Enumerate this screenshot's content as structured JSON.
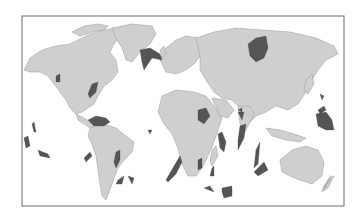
{
  "map": {
    "type": "world-map",
    "projection": "equirectangular-like",
    "colors": {
      "background": "#ffffff",
      "land": "#cfcfcf",
      "highlight_regions": "#555555",
      "frame": "#6a6a6a"
    },
    "highlighted_regions": [
      "Greenland-Iceland (North Atlantic)",
      "Columbia River (NW North America)",
      "Central Atlantic Margin (E North America)",
      "Caribbean",
      "Parana (South America)",
      "Ethiopian Traps",
      "Karoo (Southern Africa)",
      "Deccan Traps (India)",
      "Siberian Traps",
      "Ontong Java / Pacific plateaus",
      "Kerguelen Plateau",
      "Ninetyeast Ridge",
      "Walvis Ridge / Rio Grande Rise",
      "Agulhas / Mozambique",
      "Pacific seamount plateaus"
    ],
    "signature": "signature"
  }
}
